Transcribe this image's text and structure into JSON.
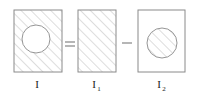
{
  "figure": {
    "background_color": "#ffffff",
    "outline_color": "#8a8a8a",
    "hatch_color": "#aaaaaa",
    "label_color": "#1a1a1a",
    "operator_color": "#555555",
    "equation": "I = I1 - I2",
    "panels": [
      {
        "id": "panel-i",
        "label": "I",
        "label_base": "I",
        "label_subscript": "",
        "rect": {
          "x": 14,
          "y": 10,
          "width": 48,
          "height": 62
        },
        "rect_fill": "hatched",
        "circle": {
          "cx": 36,
          "cy": 39,
          "r": 14
        },
        "circle_fill": "white",
        "description": "hatched rectangle with unhatched circular hole"
      },
      {
        "id": "panel-i1",
        "label": "I1",
        "label_base": "I",
        "label_subscript": "1",
        "rect": {
          "x": 78,
          "y": 10,
          "width": 38,
          "height": 62
        },
        "rect_fill": "hatched",
        "circle": null,
        "circle_fill": "none",
        "description": "fully hatched rectangle"
      },
      {
        "id": "panel-i2",
        "label": "I2",
        "label_base": "I",
        "label_subscript": "2",
        "rect": {
          "x": 138,
          "y": 10,
          "width": 47,
          "height": 62
        },
        "rect_fill": "white",
        "circle": {
          "cx": 162,
          "cy": 43,
          "r": 15
        },
        "circle_fill": "hatched",
        "description": "unhatched rectangle containing a hatched circle"
      }
    ],
    "operators": [
      {
        "id": "equals",
        "symbol": "=",
        "name": "equals-sign",
        "x": 69,
        "y": 46
      },
      {
        "id": "minus",
        "symbol": "–",
        "name": "minus-sign",
        "x": 127,
        "y": 45
      }
    ],
    "labels": [
      {
        "id": "label-i",
        "base": "I",
        "subscript": "",
        "x": 37,
        "y": 88
      },
      {
        "id": "label-i1",
        "base": "I",
        "subscript": "1",
        "x": 95,
        "y": 88
      },
      {
        "id": "label-i2",
        "base": "I",
        "subscript": "2",
        "x": 160,
        "y": 88
      }
    ],
    "hatch": {
      "angle_deg": 45,
      "direction": "bottom-left-to-top-right",
      "spacing_px": 7,
      "stroke_width": 0.8
    }
  }
}
